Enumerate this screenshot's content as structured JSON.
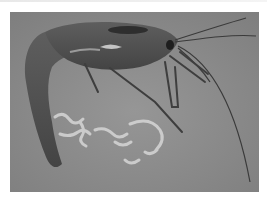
{
  "image": {
    "subject": "shrimp",
    "description": "Grayscale photograph of a shrimp on a gray surface with pale debris beneath it",
    "colors": {
      "page_background": "#ffffff",
      "photo_background": "#8c8c8c",
      "shrimp_body": "#4e4e4e",
      "shrimp_highlight": "#bdbdbd",
      "debris": "#d2d2d2"
    }
  }
}
